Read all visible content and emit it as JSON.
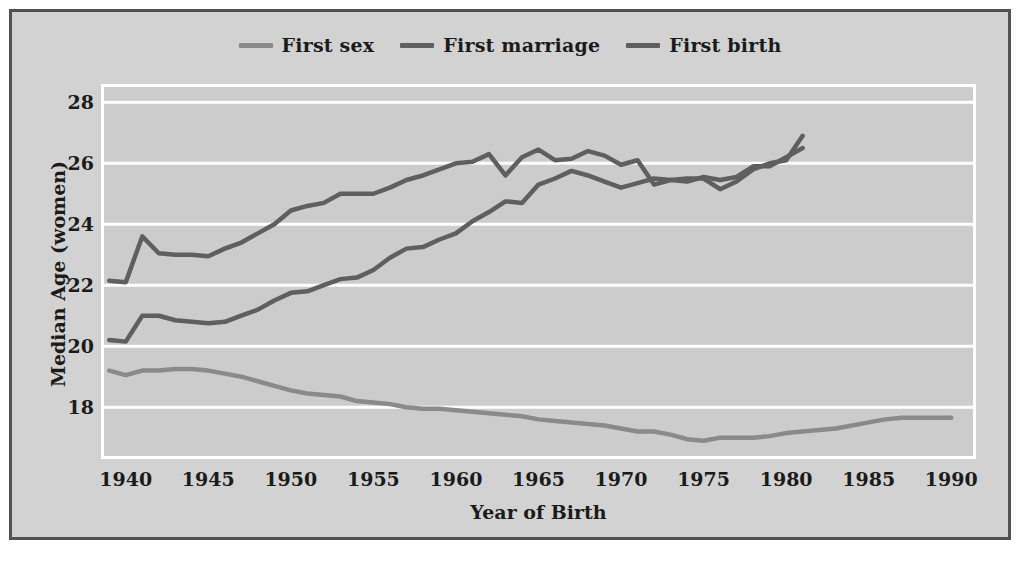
{
  "figure": {
    "background_color": "#d2d2d2",
    "border_color": "#525252",
    "plot_background_color": "#cccccc",
    "gridline_color": "#ffffff"
  },
  "legend": {
    "position": "top-center",
    "items": [
      {
        "label": "First sex",
        "color": "#8a8a8a"
      },
      {
        "label": "First marriage",
        "color": "#5f5f5f"
      },
      {
        "label": "First birth",
        "color": "#5f5f5f"
      }
    ]
  },
  "chart_data": {
    "type": "line",
    "title": "",
    "xlabel": "Year of Birth",
    "ylabel": "Median Age (women)",
    "xlim": [
      1938.5,
      1991.5
    ],
    "ylim": [
      16.3,
      28.6
    ],
    "xticks": [
      1940,
      1945,
      1950,
      1955,
      1960,
      1965,
      1970,
      1975,
      1980,
      1985,
      1990
    ],
    "yticks": [
      18,
      20,
      22,
      24,
      26,
      28
    ],
    "grid": "horizontal",
    "legend_position": "top-center",
    "series": [
      {
        "name": "First sex",
        "color": "#8a8a8a",
        "x": [
          1939,
          1940,
          1941,
          1942,
          1943,
          1944,
          1945,
          1946,
          1947,
          1948,
          1949,
          1950,
          1951,
          1952,
          1953,
          1954,
          1955,
          1956,
          1957,
          1958,
          1959,
          1960,
          1961,
          1962,
          1963,
          1964,
          1965,
          1966,
          1967,
          1968,
          1969,
          1970,
          1971,
          1972,
          1973,
          1974,
          1975,
          1976,
          1977,
          1978,
          1979,
          1980,
          1981,
          1982,
          1983,
          1984,
          1985,
          1986,
          1987,
          1988,
          1989,
          1990
        ],
        "values": [
          19.2,
          19.05,
          19.2,
          19.2,
          19.25,
          19.25,
          19.2,
          19.1,
          19.0,
          18.85,
          18.7,
          18.55,
          18.45,
          18.4,
          18.35,
          18.2,
          18.15,
          18.1,
          18.0,
          17.95,
          17.95,
          17.9,
          17.85,
          17.8,
          17.75,
          17.7,
          17.6,
          17.55,
          17.5,
          17.45,
          17.4,
          17.3,
          17.2,
          17.2,
          17.1,
          16.95,
          16.9,
          17.0,
          17.0,
          17.0,
          17.05,
          17.15,
          17.2,
          17.25,
          17.3,
          17.4,
          17.5,
          17.6,
          17.65,
          17.65,
          17.65,
          17.65
        ]
      },
      {
        "name": "First marriage",
        "color": "#5f5f5f",
        "x": [
          1939,
          1940,
          1941,
          1942,
          1943,
          1944,
          1945,
          1946,
          1947,
          1948,
          1949,
          1950,
          1951,
          1952,
          1953,
          1954,
          1955,
          1956,
          1957,
          1958,
          1959,
          1960,
          1961,
          1962,
          1963,
          1964,
          1965,
          1966,
          1967,
          1968,
          1969,
          1970,
          1971,
          1972,
          1973,
          1974,
          1975,
          1976,
          1977,
          1978,
          1979,
          1980,
          1981
        ],
        "values": [
          20.2,
          20.15,
          21.0,
          21.0,
          20.85,
          20.8,
          20.75,
          20.8,
          21.0,
          21.2,
          21.5,
          21.75,
          21.8,
          22.0,
          22.2,
          22.25,
          22.5,
          22.9,
          23.2,
          23.25,
          23.5,
          23.7,
          24.1,
          24.4,
          24.75,
          24.7,
          25.3,
          25.5,
          25.75,
          25.6,
          25.4,
          25.2,
          25.35,
          25.5,
          25.45,
          25.4,
          25.55,
          25.45,
          25.55,
          25.9,
          25.9,
          26.2,
          26.5
        ]
      },
      {
        "name": "First birth",
        "color": "#5f5f5f",
        "x": [
          1939,
          1940,
          1941,
          1942,
          1943,
          1944,
          1945,
          1946,
          1947,
          1948,
          1949,
          1950,
          1951,
          1952,
          1953,
          1954,
          1955,
          1956,
          1957,
          1958,
          1959,
          1960,
          1961,
          1962,
          1963,
          1964,
          1965,
          1966,
          1967,
          1968,
          1969,
          1970,
          1971,
          1972,
          1973,
          1974,
          1975,
          1976,
          1977,
          1978,
          1979,
          1980,
          1981
        ],
        "values": [
          22.15,
          22.1,
          23.6,
          23.05,
          23.0,
          23.0,
          22.95,
          23.2,
          23.4,
          23.7,
          24.0,
          24.45,
          24.6,
          24.7,
          25.0,
          25.0,
          25.0,
          25.2,
          25.45,
          25.6,
          25.8,
          26.0,
          26.05,
          26.3,
          25.6,
          26.2,
          26.45,
          26.1,
          26.15,
          26.4,
          26.25,
          25.95,
          26.1,
          25.3,
          25.45,
          25.5,
          25.5,
          25.15,
          25.4,
          25.8,
          26.0,
          26.1,
          26.9
        ]
      }
    ]
  }
}
